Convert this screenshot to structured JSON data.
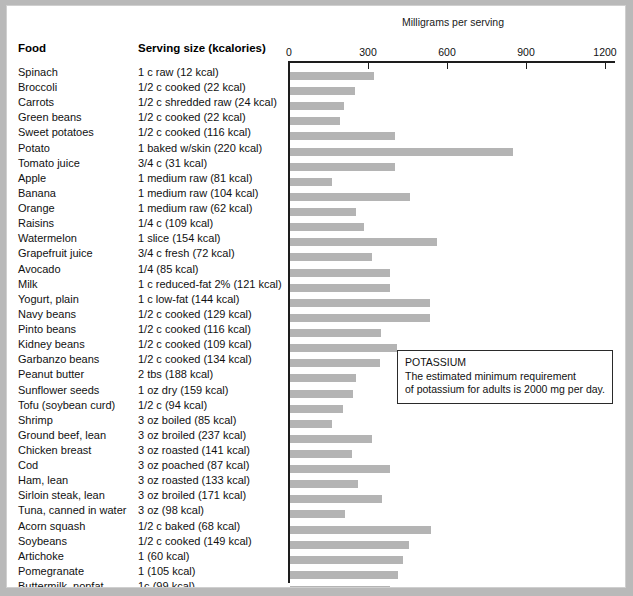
{
  "headers": {
    "food": "Food",
    "serving": "Serving size (kcalories)"
  },
  "callout": {
    "title": "POTASSIUM",
    "line1": "The estimated minimum requirement",
    "line2": "of potassium for adults is 2000 mg per day."
  },
  "chart_data": {
    "type": "bar",
    "orientation": "horizontal",
    "title": "Milligrams per serving",
    "xlabel": "Milligrams per serving",
    "ylabel": "",
    "xlim": [
      0,
      1200
    ],
    "xticks": [
      0,
      300,
      600,
      900,
      1200
    ],
    "xtick_labels": [
      "0",
      "300",
      "600",
      "900",
      "1200"
    ],
    "grid": false,
    "legend": "none",
    "units": "mg",
    "categories": [
      "Spinach",
      "Broccoli",
      "Carrots",
      "Green beans",
      "Sweet potatoes",
      "Potato",
      "Tomato juice",
      "Apple",
      "Banana",
      "Orange",
      "Raisins",
      "Watermelon",
      "Grapefruit juice",
      "Avocado",
      "Milk",
      "Yogurt, plain",
      "Navy beans",
      "Pinto beans",
      "Kidney beans",
      "Garbanzo beans",
      "Peanut butter",
      "Sunflower seeds",
      "Tofu (soybean curd)",
      "Shrimp",
      "Ground beef, lean",
      "Chicken breast",
      "Cod",
      "Ham, lean",
      "Sirloin steak, lean",
      "Tuna, canned in water",
      "Acorn squash",
      "Soybeans",
      "Artichoke",
      "Pomegranate",
      "Buttermilk, nonfat"
    ],
    "servings": [
      "1 c raw (12 kcal)",
      "1/2 c cooked (22 kcal)",
      "1/2 c shredded raw (24 kcal)",
      "1/2 c cooked (22 kcal)",
      "1/2 c cooked (116 kcal)",
      "1 baked w/skin (220 kcal)",
      "3/4 c (31 kcal)",
      "1 medium raw (81 kcal)",
      "1 medium raw (104 kcal)",
      "1 medium raw (62 kcal)",
      "1/4 c (109 kcal)",
      "1 slice (154 kcal)",
      "3/4 c fresh (72 kcal)",
      "1/4 (85 kcal)",
      "1 c reduced-fat 2% (121 kcal)",
      "1 c low-fat (144 kcal)",
      "1/2 c cooked (129 kcal)",
      "1/2 c cooked (116 kcal)",
      "1/2 c cooked (109 kcal)",
      "1/2 c cooked (134 kcal)",
      "2 tbs (188 kcal)",
      "1 oz dry (159 kcal)",
      "1/2 c (94 kcal)",
      "3 oz boiled (85 kcal)",
      "3 oz broiled (237 kcal)",
      "3 oz roasted (141 kcal)",
      "3 oz poached (87 kcal)",
      "3 oz roasted (133 kcal)",
      "3 oz broiled (171 kcal)",
      "3 oz (98 kcal)",
      "1/2 c baked (68 kcal)",
      "1/2 c cooked (149 kcal)",
      "1 (60 kcal)",
      "1 (105 kcal)",
      "1c (99 kcal)"
    ],
    "values": [
      320,
      245,
      205,
      190,
      400,
      845,
      400,
      160,
      455,
      250,
      280,
      560,
      310,
      380,
      380,
      530,
      530,
      345,
      405,
      340,
      250,
      240,
      200,
      160,
      310,
      235,
      380,
      260,
      350,
      210,
      535,
      450,
      430,
      410,
      380
    ]
  },
  "colors": {
    "bar": "#b4b4b4",
    "axis": "#1d1d1d",
    "page_background": "#ffffff",
    "surround": "#b9b9b9"
  }
}
